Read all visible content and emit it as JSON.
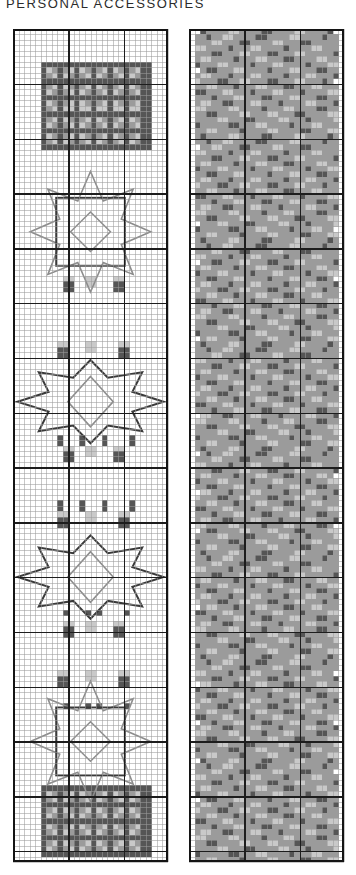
{
  "header": {
    "title": "PERSONAL ACCESSORIES"
  },
  "palette": {
    "white": "#ffffff",
    "light_gray": "#c9c9c9",
    "mid_gray": "#9b9b9b",
    "dark_gray": "#555555",
    "grid_thin": "#9a9a9a",
    "grid_bold": "#1d1d1d",
    "frame": "#141414",
    "backstitch_dark": "#3a3a3a",
    "backstitch_mid": "#8c8c8c"
  },
  "charts": [
    {
      "name": "left-chart",
      "label": "Chart A",
      "cols": 28,
      "rows": 152,
      "cell_px": 5.45,
      "bold_every": 10
    },
    {
      "name": "right-chart",
      "label": "Chart B",
      "cols": 28,
      "rows": 152,
      "cell_px": 5.45,
      "bold_every": 10
    }
  ],
  "chart_data": {
    "type": "heatmap",
    "title": "PERSONAL ACCESSORIES",
    "xlabel": "",
    "ylabel": "",
    "grid": true,
    "legend_position": "none",
    "value_levels": [
      {
        "key": 0,
        "name": "empty",
        "color": "#ffffff"
      },
      {
        "key": 1,
        "name": "light",
        "color": "#c9c9c9"
      },
      {
        "key": 2,
        "name": "mid",
        "color": "#9b9b9b"
      },
      {
        "key": 3,
        "name": "dark",
        "color": "#555555"
      }
    ],
    "axis_ranges": {
      "x": [
        1,
        28
      ],
      "y": [
        1,
        152
      ]
    },
    "left_chart_blocks": [
      {
        "type": "solid-block",
        "row_start": 6,
        "row_end": 21,
        "col_start": 5,
        "col_end": 24
      },
      {
        "type": "star-medallion",
        "center_row": 37,
        "center_col": 14,
        "radius": 11
      },
      {
        "type": "checker-row",
        "row_start": 45,
        "row_end": 49,
        "col_start": 8,
        "col_end": 21
      },
      {
        "type": "checker-row",
        "row_start": 57,
        "row_end": 61,
        "col_start": 8,
        "col_end": 21
      },
      {
        "type": "wide-star-medallion",
        "center_row": 68,
        "center_col": 14,
        "radius": 10
      },
      {
        "type": "checker-row",
        "row_start": 76,
        "row_end": 81,
        "col_start": 7,
        "col_end": 22
      },
      {
        "type": "checker-row",
        "row_start": 88,
        "row_end": 93,
        "col_start": 7,
        "col_end": 22
      },
      {
        "type": "wide-star-medallion",
        "center_row": 100,
        "center_col": 14,
        "radius": 10
      },
      {
        "type": "checker-row",
        "row_start": 108,
        "row_end": 112,
        "col_start": 8,
        "col_end": 21
      },
      {
        "type": "checker-row",
        "row_start": 117,
        "row_end": 121,
        "col_start": 8,
        "col_end": 21
      },
      {
        "type": "star-medallion",
        "center_row": 130,
        "center_col": 14,
        "radius": 11
      },
      {
        "type": "solid-block",
        "row_start": 138,
        "row_end": 150,
        "col_start": 5,
        "col_end": 24
      }
    ],
    "right_chart_fill": {
      "background_level": 2,
      "accent_levels": [
        0,
        1,
        3
      ],
      "coverage_pct": 96,
      "motif": "interlocking diagonal lattice repeated vertically"
    }
  }
}
